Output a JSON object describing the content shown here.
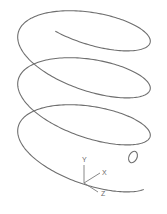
{
  "diagram": {
    "type": "helix-wireframe",
    "background": "#ffffff",
    "stroke_color": "#6e6e6e",
    "helix": {
      "turns": 3.25,
      "center_x": 84,
      "base_y": 165,
      "radius_x": 68,
      "radius_y": 27,
      "pitch_px": 47,
      "tilt_deg": 14,
      "start_angle_deg": 20
    },
    "end_marker": {
      "cx": 133,
      "cy": 157,
      "rx": 4,
      "ry": 6,
      "rotate_deg": 25
    },
    "ucs_icon": {
      "origin": [
        84,
        183
      ],
      "axes": [
        {
          "label": "Y",
          "end": [
            84,
            165
          ],
          "label_pos": [
            82,
            162
          ]
        },
        {
          "label": "X",
          "end": [
            100,
            173
          ],
          "label_pos": [
            102,
            175
          ]
        },
        {
          "label": "Z",
          "end": [
            98,
            192
          ],
          "label_pos": [
            101,
            196
          ]
        }
      ]
    }
  }
}
